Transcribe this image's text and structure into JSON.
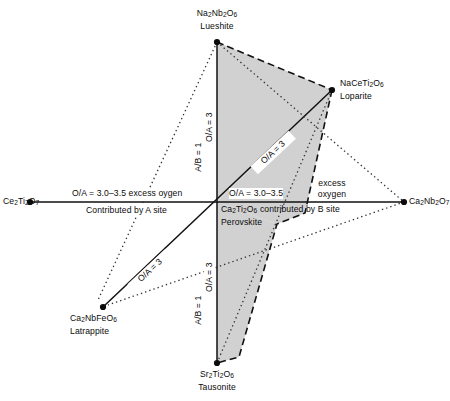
{
  "figure": {
    "type": "diagram",
    "background": "#ffffff",
    "shade_color": "#c8c8c8",
    "line_color": "#111111"
  },
  "vertices": {
    "lueshite": {
      "formula_html": "Na<sub>2</sub>Nb<sub>2</sub>O<sub>6</sub>",
      "formula": "Na2Nb2O6",
      "mineral": "Lueshite",
      "x": 217,
      "y": 42
    },
    "loparite": {
      "formula_html": "NaCeTi<sub>2</sub>O<sub>6</sub>",
      "formula": "NaCeTi2O6",
      "mineral": "Loparite",
      "x": 332,
      "y": 90
    },
    "ca2nb2o7": {
      "formula_html": "Ca<sub>2</sub>Nb<sub>2</sub>O<sub>7</sub>",
      "formula": "Ca2Nb2O7",
      "mineral": "",
      "x": 404,
      "y": 202
    },
    "tausonite": {
      "formula_html": "Sr<sub>2</sub>Ti<sub>2</sub>O<sub>6</sub>",
      "formula": "Sr2Ti2O6",
      "mineral": "Tausonite",
      "x": 217,
      "y": 363
    },
    "latrappite": {
      "formula_html": "Ca<sub>2</sub>NbFeO<sub>6</sub>",
      "formula": "Ca2NbFeO6",
      "mineral": "Latrappite",
      "x": 103,
      "y": 307
    },
    "ce2ti2o7": {
      "formula_html": "Ce<sub>2</sub>Ti<sub>2</sub>O<sub>7</sub>",
      "formula": "Ce2Ti2O7",
      "mineral": "",
      "x": 30,
      "y": 202
    },
    "perovskite": {
      "formula_html": "Ca<sub>2</sub>Ti<sub>2</sub>O<sub>6</sub>",
      "formula": "Ca2Ti2O6",
      "mineral": "Perovskite",
      "x": 217,
      "y": 202
    }
  },
  "axis_labels": {
    "upper_oa": "O/A = 3",
    "upper_ab": "A/B = 1",
    "lower_oa": "O/A = 3",
    "lower_ab": "A/B = 1",
    "diag_upper_right_oa": "O/A = 3",
    "diag_lower_left_oa": "O/A = 3"
  },
  "annotations": {
    "left_upper": "O/A = 3.0–3.5 excess oygen",
    "left_lower": "Contributed by A site",
    "right_upper": "O/A = 3.0–3.5",
    "excess_line1": "excess",
    "excess_line2": "oxygen",
    "right_lower": "contributed by B site"
  }
}
